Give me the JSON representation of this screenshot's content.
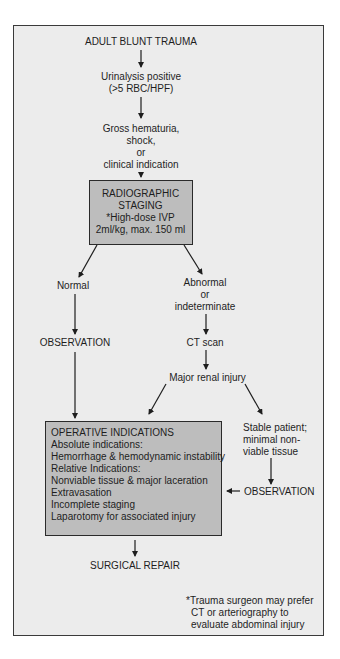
{
  "flowchart": {
    "start": "ADULT BLUNT TRAUMA",
    "urinalysis": [
      "Urinalysis positive",
      "(>5 RBC/HPF)"
    ],
    "criteria": [
      "Gross hematuria,",
      "shock,",
      "or",
      "clinical indication"
    ],
    "staging_box": [
      "RADIOGRAPHIC",
      "STAGING",
      "*High-dose IVP",
      "2ml/kg, max. 150 ml"
    ],
    "normal": "Normal",
    "abnormal": [
      "Abnormal",
      "or",
      "indeterminate"
    ],
    "observation_left": "OBSERVATION",
    "ct_scan": "CT scan",
    "major_renal_injury": "Major renal injury",
    "stable_patient": [
      "Stable patient;",
      "minimal non-",
      "viable tissue"
    ],
    "observation_right": "OBSERVATION",
    "operative_box": {
      "title": "OPERATIVE INDICATIONS",
      "lines": [
        "Absolute indications:",
        "Hemorrhage & hemodynamic instability",
        "Relative Indications:",
        "Nonviable tissue & major laceration",
        "Extravasation",
        "Incomplete staging",
        "Laparotomy for associated injury"
      ]
    },
    "surgical_repair": "SURGICAL REPAIR",
    "footnote": [
      "*Trauma surgeon may prefer",
      "CT or arteriography to",
      "evaluate abdominal injury"
    ]
  },
  "colors": {
    "background": "#ececec",
    "box_fill": "#bdbdbd",
    "line": "#1e1e1e"
  }
}
